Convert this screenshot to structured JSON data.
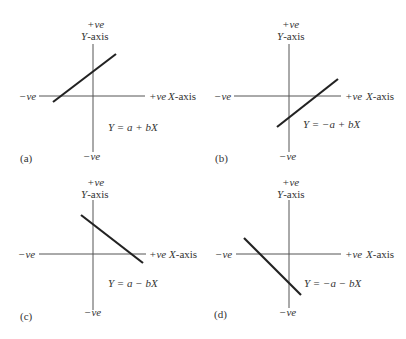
{
  "figure": {
    "panels": [
      {
        "id": "a",
        "label": "(a)",
        "y_pos": "+ve",
        "y_axis": "Y-axis",
        "y_neg": "−ve",
        "x_neg": "−ve",
        "x_pos": "+ve",
        "x_axis": "X-axis",
        "equation": "Y = a + bX",
        "slope": "positive",
        "intercept": "positive"
      },
      {
        "id": "b",
        "label": "(b)",
        "y_pos": "+ve",
        "y_axis": "Y-axis",
        "y_neg": "−ve",
        "x_neg": "−ve",
        "x_pos": "+ve",
        "x_axis": "X-axis",
        "equation": "Y = −a + bX",
        "slope": "positive",
        "intercept": "negative"
      },
      {
        "id": "c",
        "label": "(c)",
        "y_pos": "+ve",
        "y_axis": "Y-axis",
        "y_neg": "−ve",
        "x_neg": "−ve",
        "x_pos": "+ve",
        "x_axis": "X-axis",
        "equation": "Y = a − bX",
        "slope": "negative",
        "intercept": "positive"
      },
      {
        "id": "d",
        "label": "(d)",
        "y_pos": "+ve",
        "y_axis": "Y-axis",
        "y_neg": "−ve",
        "x_neg": "−ve",
        "x_pos": "+ve",
        "x_axis": "X-axis",
        "equation": "Y = −a − bX",
        "slope": "negative",
        "intercept": "negative"
      }
    ]
  },
  "colors": {
    "axis": "#555555",
    "line": "#222222",
    "text": "#333333"
  }
}
